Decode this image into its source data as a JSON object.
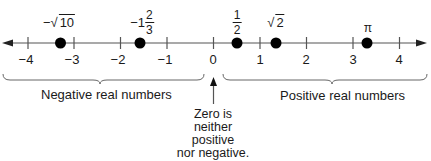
{
  "diagram": {
    "type": "number-line",
    "axis": {
      "min": -4,
      "max": 4,
      "tick_labels": [
        "−4",
        "−3",
        "−2",
        "−1",
        "0",
        "1",
        "2",
        "3",
        "4"
      ],
      "tick_values": [
        -4,
        -3,
        -2,
        -1,
        0,
        1,
        2,
        3,
        4
      ],
      "arrows": "both",
      "color": "#555555"
    },
    "points": [
      {
        "value": -3.162,
        "label_prefix": "−",
        "label_radical": "10",
        "kind": "sqrt"
      },
      {
        "value": -1.667,
        "label_prefix": "−1",
        "numerator": "2",
        "denominator": "3",
        "kind": "mixed"
      },
      {
        "value": 0.5,
        "numerator": "1",
        "denominator": "2",
        "kind": "fraction"
      },
      {
        "value": 1.414,
        "label_radical": "2",
        "kind": "sqrt"
      },
      {
        "value": 3.1416,
        "label": "π",
        "kind": "symbol"
      }
    ],
    "regions": {
      "negative": "Negative real numbers",
      "positive": "Positive real numbers"
    },
    "zero_note": {
      "lines": [
        "Zero is",
        "neither",
        "positive",
        "nor negative."
      ]
    },
    "dot_color": "#000000"
  }
}
